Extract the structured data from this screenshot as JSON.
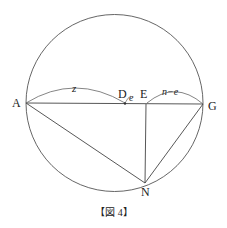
{
  "figure": {
    "caption": "【図 4】",
    "points": {
      "A": "A",
      "D": "D",
      "E": "E",
      "G": "G",
      "N": "N"
    },
    "segment_labels": {
      "AD": "z",
      "DE": "e",
      "EG": "n−e"
    },
    "colors": {
      "line": "#333333",
      "text": "#222222"
    }
  }
}
